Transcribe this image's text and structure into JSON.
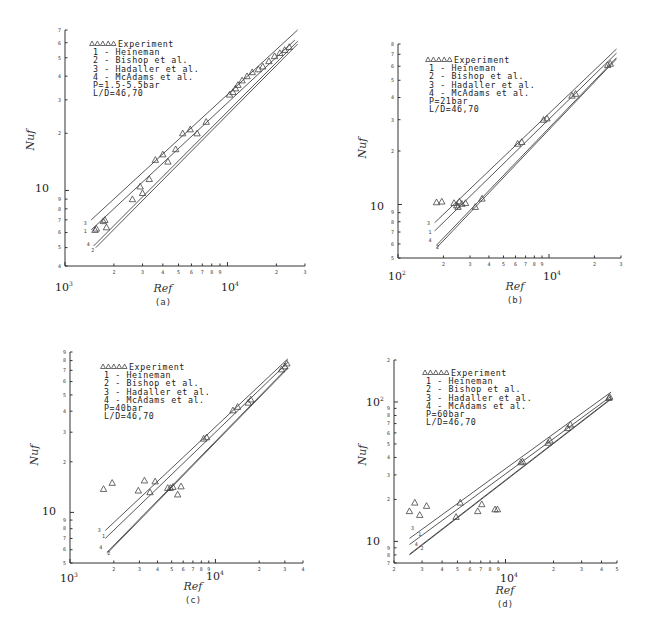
{
  "figure": {
    "legend_common": {
      "experiment_label": "Experiment",
      "correlations": [
        "1 - Heineman",
        "2 - Bishop et al.",
        "3 - Hadaller et al.",
        "4 - McAdams et al."
      ],
      "ld_label": "L/D=46,70"
    }
  },
  "chart_data": [
    {
      "type": "scatter",
      "panel_label": "(a)",
      "title": "",
      "xlabel": "Ref",
      "ylabel": "Nuf",
      "xscale": "log",
      "yscale": "log",
      "xlim": [
        1000,
        30000
      ],
      "ylim": [
        4,
        70
      ],
      "x_tick_labels": [
        "10^3",
        "2",
        "3",
        "4",
        "5",
        "6",
        "7",
        "8",
        "9",
        "10^4",
        "2",
        "3"
      ],
      "y_tick_labels": [
        "4",
        "5",
        "6",
        "7",
        "8",
        "9",
        "10",
        "2",
        "3",
        "4",
        "5",
        "6",
        "7"
      ],
      "grid": false,
      "legend": [
        "Experiment",
        "1 - Heineman",
        "2 - Bishop et al.",
        "3 - Hadaller et al.",
        "4 - McAdams et al."
      ],
      "legend_position": "upper left",
      "annotations": [
        "P=1.5-5.5bar",
        "L/D=46,70"
      ],
      "experiment": {
        "x": [
          1530,
          1560,
          1720,
          1760,
          1800,
          2600,
          2900,
          3000,
          3300,
          3600,
          4000,
          4300,
          4800,
          5300,
          5900,
          6500,
          7400,
          10300,
          10800,
          11200,
          11600,
          12300,
          13200,
          14200,
          15500,
          16500,
          18000,
          19500,
          21000,
          22500,
          24000
        ],
        "y": [
          6.2,
          6.3,
          6.9,
          7.0,
          6.4,
          9.0,
          10.5,
          9.7,
          11.5,
          14.5,
          15.5,
          14.2,
          16.5,
          20.0,
          21.0,
          20.0,
          23.0,
          32.0,
          33.0,
          34.5,
          36.0,
          38.0,
          40.0,
          42.0,
          43.5,
          45.0,
          48.0,
          51.0,
          53.0,
          55.0,
          57.0
        ]
      },
      "series": [
        {
          "name": "1 - Heineman",
          "x": [
            1450,
            26000
          ],
          "y": [
            6.2,
            62.0
          ]
        },
        {
          "name": "2 - Bishop et al.",
          "x": [
            1550,
            27000
          ],
          "y": [
            5.0,
            59.0
          ]
        },
        {
          "name": "3 - Hadaller et al.",
          "x": [
            1450,
            27000
          ],
          "y": [
            7.0,
            70.0
          ]
        },
        {
          "name": "4 - McAdams et al.",
          "x": [
            1500,
            27000
          ],
          "y": [
            5.1,
            61.0
          ]
        }
      ],
      "series_end_labels": [
        {
          "label": "3",
          "x": 1400,
          "y": 6.7
        },
        {
          "label": "1",
          "x": 1400,
          "y": 6.1
        },
        {
          "label": "4",
          "x": 1460,
          "y": 5.2
        },
        {
          "label": "2",
          "x": 1560,
          "y": 4.85
        }
      ]
    },
    {
      "type": "scatter",
      "panel_label": "(b)",
      "title": "",
      "xlabel": "Ref",
      "ylabel": "Nuf",
      "xscale": "log",
      "yscale": "log",
      "xlim": [
        1000,
        30000
      ],
      "ylim": [
        5,
        80
      ],
      "x_tick_labels": [
        "10^3",
        "2",
        "3",
        "4",
        "5",
        "6",
        "7",
        "8",
        "9",
        "10^4",
        "2",
        "3"
      ],
      "y_tick_labels": [
        "5",
        "6",
        "7",
        "8",
        "9",
        "10",
        "2",
        "3",
        "4",
        "5",
        "6",
        "7",
        "8"
      ],
      "grid": false,
      "legend": [
        "Experiment",
        "1 - Heineman",
        "2 - Bishop et al.",
        "3 - Hadaller et al.",
        "4 - McAdams et al."
      ],
      "legend_position": "upper left",
      "annotations": [
        "P=21bar",
        "L/D=46,70"
      ],
      "experiment": {
        "x": [
          1800,
          1950,
          2350,
          2450,
          2500,
          2550,
          2650,
          2800,
          3250,
          3600,
          6200,
          6600,
          9200,
          9700,
          14200,
          15000,
          24500,
          25500
        ],
        "y": [
          10.3,
          10.4,
          10.2,
          9.9,
          9.7,
          10.4,
          10.1,
          10.2,
          9.7,
          10.8,
          22.0,
          22.5,
          30.0,
          30.5,
          41.0,
          42.0,
          61.0,
          62.0
        ]
      },
      "series": [
        {
          "name": "1 - Heineman",
          "x": [
            1750,
            28000
          ],
          "y": [
            7.1,
            71.0
          ]
        },
        {
          "name": "2 - Bishop et al.",
          "x": [
            1800,
            28000
          ],
          "y": [
            5.7,
            66.0
          ]
        },
        {
          "name": "3 - Hadaller et al.",
          "x": [
            1750,
            28000
          ],
          "y": [
            7.9,
            75.0
          ]
        },
        {
          "name": "4 - McAdams et al.",
          "x": [
            1800,
            28000
          ],
          "y": [
            5.9,
            67.0
          ]
        }
      ],
      "series_end_labels": [
        {
          "label": "3",
          "x": 1680,
          "y": 7.9
        },
        {
          "label": "1",
          "x": 1720,
          "y": 7.0
        },
        {
          "label": "4",
          "x": 1720,
          "y": 6.3
        },
        {
          "label": "2",
          "x": 1930,
          "y": 5.8
        }
      ]
    },
    {
      "type": "scatter",
      "panel_label": "(c)",
      "title": "",
      "xlabel": "Ref",
      "ylabel": "Nuf",
      "xscale": "log",
      "yscale": "log",
      "xlim": [
        1000,
        40000
      ],
      "ylim": [
        5,
        90
      ],
      "x_tick_labels": [
        "10^3",
        "2",
        "3",
        "4",
        "5",
        "6",
        "7",
        "8",
        "9",
        "10^4",
        "2",
        "3",
        "4"
      ],
      "y_tick_labels": [
        "5",
        "6",
        "7",
        "8",
        "9",
        "10",
        "2",
        "3",
        "4",
        "5",
        "6",
        "7",
        "8",
        "9"
      ],
      "grid": false,
      "legend": [
        "Experiment",
        "1 - Heineman",
        "2 - Bishop et al.",
        "3 - Hadaller et al.",
        "4 - McAdams et al."
      ],
      "legend_position": "upper left",
      "annotations": [
        "P=40bar",
        "L/D=46,70"
      ],
      "experiment": {
        "x": [
          1700,
          1950,
          2950,
          3250,
          3550,
          3850,
          4700,
          4900,
          5100,
          5500,
          5800,
          8300,
          8700,
          13200,
          14200,
          16800,
          17500,
          28500,
          30000,
          31000
        ],
        "y": [
          13.8,
          15.0,
          13.5,
          15.5,
          13.2,
          15.3,
          14.0,
          14.0,
          14.2,
          12.8,
          14.3,
          27.5,
          28.0,
          40.5,
          42.5,
          45.0,
          47.0,
          71.0,
          74.0,
          77.0
        ]
      },
      "series": [
        {
          "name": "1 - Heineman",
          "x": [
            1750,
            31500
          ],
          "y": [
            7.0,
            78.0
          ]
        },
        {
          "name": "2 - Bishop et al.",
          "x": [
            1800,
            31500
          ],
          "y": [
            5.7,
            72.0
          ]
        },
        {
          "name": "3 - Hadaller et al.",
          "x": [
            1750,
            31500
          ],
          "y": [
            7.8,
            82.0
          ]
        },
        {
          "name": "4 - McAdams et al.",
          "x": [
            1800,
            31500
          ],
          "y": [
            5.8,
            73.0
          ]
        }
      ],
      "series_end_labels": [
        {
          "label": "3",
          "x": 1680,
          "y": 7.9
        },
        {
          "label": "1",
          "x": 1800,
          "y": 7.2
        },
        {
          "label": "4",
          "x": 1720,
          "y": 6.2
        },
        {
          "label": "2",
          "x": 1950,
          "y": 5.7
        }
      ]
    },
    {
      "type": "scatter",
      "panel_label": "(d)",
      "title": "",
      "xlabel": "Ref",
      "ylabel": "Nuf",
      "xscale": "log",
      "yscale": "log",
      "xlim": [
        2000,
        50000
      ],
      "ylim": [
        7,
        200
      ],
      "x_tick_labels": [
        "2",
        "3",
        "4",
        "5",
        "6",
        "7",
        "8",
        "9",
        "10^4",
        "2",
        "3",
        "4",
        "5"
      ],
      "y_tick_labels": [
        "7",
        "8",
        "9",
        "10",
        "2",
        "3",
        "4",
        "5",
        "6",
        "7",
        "8",
        "9",
        "10^2",
        "2"
      ],
      "grid": false,
      "legend": [
        "Experiment",
        "1 - Heineman",
        "2 - Bishop et al.",
        "3 - Hadaller et al.",
        "4 - McAdams et al."
      ],
      "legend_position": "upper left",
      "annotations": [
        "P=60bar",
        "L/D=46,70"
      ],
      "experiment": {
        "x": [
          2500,
          2700,
          2900,
          3200,
          4900,
          5200,
          6700,
          7100,
          8600,
          8900,
          12500,
          12800,
          18500,
          19000,
          24500,
          25500,
          44500,
          45000
        ],
        "y": [
          16.5,
          19.0,
          15.5,
          18.0,
          15.0,
          19.0,
          16.5,
          18.5,
          17.0,
          17.0,
          37.0,
          37.5,
          51.0,
          53.0,
          65.0,
          69.0,
          107.0,
          109.0
        ]
      },
      "series": [
        {
          "name": "1 - Heineman",
          "x": [
            2500,
            46000
          ],
          "y": [
            9.5,
            110.0
          ]
        },
        {
          "name": "2 - Bishop et al.",
          "x": [
            2500,
            46000
          ],
          "y": [
            8.0,
            105.0
          ]
        },
        {
          "name": "3 - Hadaller et al.",
          "x": [
            2500,
            46000
          ],
          "y": [
            10.5,
            118.0
          ]
        },
        {
          "name": "4 - McAdams et al.",
          "x": [
            2500,
            46000
          ],
          "y": [
            8.1,
            106.0
          ]
        }
      ],
      "series_end_labels": [
        {
          "label": "3",
          "x": 2750,
          "y": 12.5
        },
        {
          "label": "1",
          "x": 3050,
          "y": 11.3
        },
        {
          "label": "4",
          "x": 2900,
          "y": 9.6
        },
        {
          "label": "2",
          "x": 3150,
          "y": 9.0
        }
      ]
    }
  ],
  "panels_layout": [
    {
      "frame": {
        "left": 65,
        "right": 305,
        "top": 30,
        "bottom": 266
      },
      "legend": {
        "x": 92,
        "y": 47
      },
      "ylabel_pos": {
        "x": 34,
        "y": 140
      },
      "dec_labels": [
        {
          "text": "10",
          "exp": "3",
          "x": 55,
          "y": 291
        },
        {
          "text": "10",
          "exp": "4",
          "x": 221,
          "y": 291
        },
        {
          "text": "10",
          "exp": "",
          "x": 35,
          "y": 192
        }
      ],
      "xlabel_pos": {
        "x": 163,
        "y": 292
      },
      "sublabel_pos": {
        "x": 163,
        "y": 305
      }
    },
    {
      "frame": {
        "left": 398,
        "right": 621,
        "top": 44,
        "bottom": 258
      },
      "legend": {
        "x": 428,
        "y": 63
      },
      "ylabel_pos": {
        "x": 366,
        "y": 148
      },
      "dec_labels": [
        {
          "text": "10",
          "exp": "2",
          "x": 388,
          "y": 280
        },
        {
          "text": "10",
          "exp": "4",
          "x": 543,
          "y": 280
        },
        {
          "text": "10",
          "exp": "",
          "x": 370,
          "y": 210
        }
      ],
      "xlabel_pos": {
        "x": 515,
        "y": 290
      },
      "sublabel_pos": {
        "x": 515,
        "y": 303
      }
    },
    {
      "frame": {
        "left": 70,
        "right": 303,
        "top": 352,
        "bottom": 563
      },
      "legend": {
        "x": 103,
        "y": 370
      },
      "ylabel_pos": {
        "x": 38,
        "y": 455
      },
      "dec_labels": [
        {
          "text": "10",
          "exp": "3",
          "x": 60,
          "y": 582
        },
        {
          "text": "10",
          "exp": "4",
          "x": 206,
          "y": 580
        },
        {
          "text": "10",
          "exp": "",
          "x": 42,
          "y": 515
        }
      ],
      "xlabel_pos": {
        "x": 193,
        "y": 590
      },
      "sublabel_pos": {
        "x": 193,
        "y": 603
      }
    },
    {
      "frame": {
        "left": 394,
        "right": 617,
        "top": 360,
        "bottom": 563
      },
      "legend": {
        "x": 425,
        "y": 376
      },
      "ylabel_pos": {
        "x": 366,
        "y": 455
      },
      "dec_labels": [
        {
          "text": "10",
          "exp": "2",
          "x": 366,
          "y": 406
        },
        {
          "text": "10",
          "exp": "4",
          "x": 500,
          "y": 582
        },
        {
          "text": "10",
          "exp": "",
          "x": 366,
          "y": 545
        }
      ],
      "xlabel_pos": {
        "x": 505,
        "y": 594
      },
      "sublabel_pos": {
        "x": 505,
        "y": 607
      }
    }
  ]
}
